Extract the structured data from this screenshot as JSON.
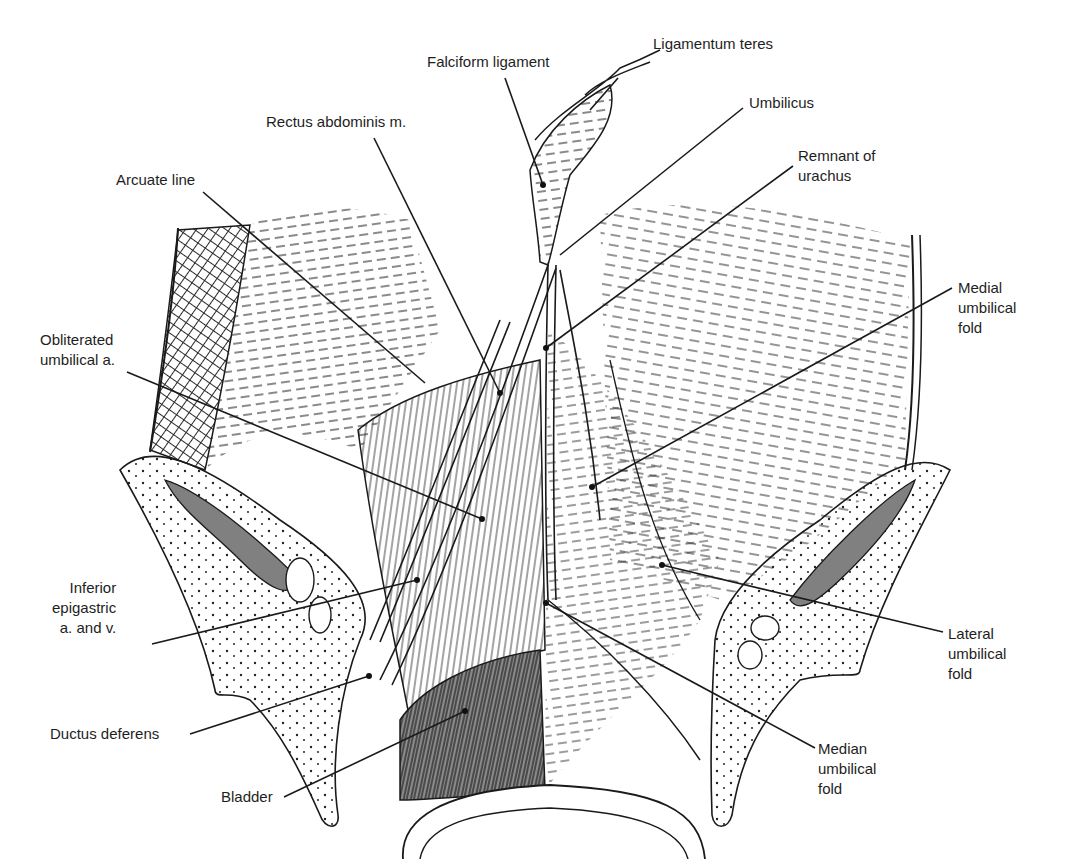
{
  "figure": {
    "colors": {
      "ink": "#1a1a1a",
      "shade": "#7a7a7a",
      "paper": "#ffffff"
    }
  },
  "labels": [
    {
      "id": "ligamentum-teres",
      "lines": [
        "Ligamentum teres"
      ],
      "x": 653,
      "y": 34,
      "align": "left",
      "anchor": [
        618,
        78
      ],
      "target": [
        590,
        110
      ]
    },
    {
      "id": "falciform-ligament",
      "lines": [
        "Falciform ligament"
      ],
      "x": 427,
      "y": 52,
      "align": "left",
      "anchor": [
        505,
        78
      ],
      "target": [
        543,
        185
      ]
    },
    {
      "id": "umbilicus",
      "lines": [
        "Umbilicus"
      ],
      "x": 749,
      "y": 93,
      "align": "left",
      "anchor": [
        743,
        108
      ],
      "target": [
        560,
        255
      ]
    },
    {
      "id": "rectus-abdominis",
      "lines": [
        "Rectus abdominis m."
      ],
      "x": 266,
      "y": 112,
      "align": "left",
      "anchor": [
        374,
        138
      ],
      "target": [
        500,
        393
      ]
    },
    {
      "id": "remnant-of-urachus",
      "lines": [
        "Remnant of",
        "urachus"
      ],
      "x": 798,
      "y": 146,
      "align": "left",
      "anchor": [
        793,
        166
      ],
      "target": [
        546,
        348
      ]
    },
    {
      "id": "arcuate-line",
      "lines": [
        "Arcuate line"
      ],
      "x": 116,
      "y": 170,
      "align": "left",
      "anchor": [
        203,
        192
      ],
      "target": [
        425,
        383
      ]
    },
    {
      "id": "medial-umbilical-fold",
      "lines": [
        "Medial",
        "umbilical",
        "fold"
      ],
      "x": 958,
      "y": 278,
      "align": "left",
      "anchor": [
        952,
        288
      ],
      "target": [
        592,
        487
      ]
    },
    {
      "id": "obliterated-umbilical-a",
      "lines": [
        "Obliterated",
        "umbilical a."
      ],
      "x": 40,
      "y": 330,
      "align": "left",
      "anchor": [
        127,
        372
      ],
      "target": [
        482,
        519
      ]
    },
    {
      "id": "inferior-epigastric",
      "lines": [
        "Inferior",
        "epigastric",
        "a. and v."
      ],
      "x": 52,
      "y": 578,
      "align": "right",
      "anchor": [
        152,
        644
      ],
      "target": [
        417,
        580
      ]
    },
    {
      "id": "lateral-umbilical-fold",
      "lines": [
        "Lateral",
        "umbilical",
        "fold"
      ],
      "x": 948,
      "y": 624,
      "align": "left",
      "anchor": [
        943,
        632
      ],
      "target": [
        662,
        565
      ]
    },
    {
      "id": "ductus-deferens",
      "lines": [
        "Ductus deferens"
      ],
      "x": 50,
      "y": 724,
      "align": "left",
      "anchor": [
        190,
        734
      ],
      "target": [
        369,
        676
      ]
    },
    {
      "id": "median-umbilical-fold",
      "lines": [
        "Median",
        "umbilical",
        "fold"
      ],
      "x": 818,
      "y": 739,
      "align": "left",
      "anchor": [
        815,
        748
      ],
      "target": [
        546,
        603
      ]
    },
    {
      "id": "bladder",
      "lines": [
        "Bladder"
      ],
      "x": 221,
      "y": 787,
      "align": "left",
      "anchor": [
        284,
        797
      ],
      "target": [
        465,
        711
      ]
    }
  ]
}
